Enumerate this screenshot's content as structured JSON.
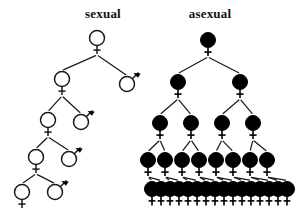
{
  "figure": {
    "width": 300,
    "height": 214,
    "background": "#ffffff",
    "ink_color": "#111111"
  },
  "panels": [
    {
      "id": "sexual",
      "title": "sexual",
      "title_x": 103,
      "title_y": 18
    },
    {
      "id": "asexual",
      "title": "asexual",
      "title_x": 210,
      "title_y": 18
    }
  ],
  "symbols": {
    "female_name": "female-symbol",
    "male_name": "male-symbol",
    "female_glyph": "circle-with-cross-below",
    "male_glyph": "circle-with-arrow-upper-right",
    "open_fill": "#ffffff",
    "solid_fill": "#000000",
    "stroke": "#1a1a1a"
  },
  "chart_data": {
    "type": "diagram",
    "generations": 6,
    "series": [
      {
        "name": "sexual",
        "females_per_generation": [
          1,
          1,
          1,
          1,
          1,
          1
        ],
        "males_per_generation": [
          0,
          1,
          1,
          1,
          1,
          1
        ],
        "total_per_generation": [
          1,
          2,
          2,
          2,
          2,
          2
        ]
      },
      {
        "name": "asexual",
        "females_per_generation": [
          1,
          2,
          4,
          8,
          16,
          16
        ],
        "males_per_generation": [
          0,
          0,
          0,
          0,
          0,
          0
        ],
        "total_per_generation": [
          1,
          2,
          4,
          8,
          16,
          16
        ]
      }
    ]
  },
  "sexual_tree": {
    "fill": "open",
    "nodes": [
      {
        "id": "s0f",
        "sex": "female",
        "x": 97,
        "y": 38,
        "r": 7.5,
        "gen": 0
      },
      {
        "id": "s1f",
        "sex": "female",
        "x": 62,
        "y": 79,
        "r": 7.5,
        "gen": 1
      },
      {
        "id": "s1m",
        "sex": "male",
        "x": 127,
        "y": 84,
        "r": 7.5,
        "gen": 1
      },
      {
        "id": "s2f",
        "sex": "female",
        "x": 48,
        "y": 120,
        "r": 7.5,
        "gen": 2
      },
      {
        "id": "s2m",
        "sex": "male",
        "x": 81,
        "y": 122,
        "r": 7.5,
        "gen": 2
      },
      {
        "id": "s3f",
        "sex": "female",
        "x": 36,
        "y": 157,
        "r": 7.5,
        "gen": 3
      },
      {
        "id": "s3m",
        "sex": "male",
        "x": 69,
        "y": 159,
        "r": 7.5,
        "gen": 3
      },
      {
        "id": "s4f",
        "sex": "female",
        "x": 22,
        "y": 192,
        "r": 7.5,
        "gen": 4
      },
      {
        "id": "s4m",
        "sex": "male",
        "x": 55,
        "y": 192,
        "r": 7.5,
        "gen": 4
      }
    ],
    "edges": [
      {
        "from": "s0f",
        "to": "s1f"
      },
      {
        "from": "s0f",
        "to": "s1m"
      },
      {
        "from": "s1f",
        "to": "s2f"
      },
      {
        "from": "s1f",
        "to": "s2m"
      },
      {
        "from": "s2f",
        "to": "s3f"
      },
      {
        "from": "s2f",
        "to": "s3m"
      },
      {
        "from": "s3f",
        "to": "s4f"
      },
      {
        "from": "s3f",
        "to": "s4m"
      }
    ]
  },
  "asexual_tree": {
    "fill": "solid",
    "rows": [
      {
        "gen": 0,
        "y": 40,
        "r": 7.5,
        "count": 1,
        "x_start": 208,
        "x_step": 0
      },
      {
        "gen": 1,
        "y": 82,
        "r": 7.5,
        "count": 2,
        "x_start": 178,
        "x_step": 62
      },
      {
        "gen": 2,
        "y": 123,
        "r": 7.5,
        "count": 4,
        "x_start": 160,
        "x_step": 31
      },
      {
        "gen": 3,
        "y": 160,
        "r": 7.5,
        "count": 8,
        "x_start": 148,
        "x_step": 17
      },
      {
        "gen": 4,
        "y": 189,
        "r": 7.5,
        "count": 16,
        "x_start": 152,
        "x_step": 9
      }
    ],
    "crosses_bottom": {
      "count": 16,
      "y": 197,
      "x_start": 152,
      "x_step": 9
    }
  }
}
